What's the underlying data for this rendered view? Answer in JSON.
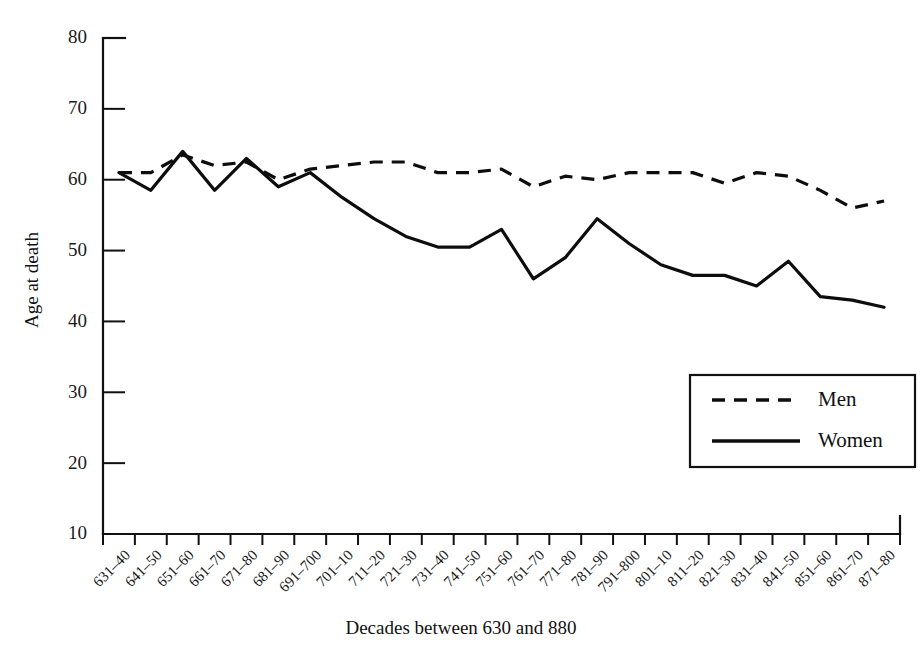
{
  "chart_data": {
    "type": "line",
    "title": "",
    "xlabel": "Decades between 630 and 880",
    "ylabel": "Age at death",
    "ylim": [
      10,
      80
    ],
    "yticks": [
      10,
      20,
      30,
      40,
      50,
      60,
      70,
      80
    ],
    "ytick_labels": [
      "10",
      "20",
      "30",
      "40",
      "50",
      "60",
      "70",
      "80"
    ],
    "grid": false,
    "legend_position": "lower-right",
    "categories": [
      "631–40",
      "641–50",
      "651–60",
      "661–70",
      "671–80",
      "681–90",
      "691–700",
      "701–10",
      "711–20",
      "721–30",
      "731–40",
      "741–50",
      "751–60",
      "761–70",
      "771–80",
      "781–90",
      "791–800",
      "801–10",
      "811–20",
      "821–30",
      "831–40",
      "841–50",
      "851–60",
      "861–70",
      "871–80"
    ],
    "series": [
      {
        "name": "Men",
        "style": "dashed",
        "values": [
          61,
          61,
          63.5,
          62,
          62.5,
          60,
          61.5,
          62,
          62.5,
          62.5,
          61,
          61,
          61.5,
          59,
          60.5,
          60,
          61,
          61,
          61,
          59.5,
          61,
          60.5,
          58.5,
          56,
          57
        ]
      },
      {
        "name": "Women",
        "style": "solid",
        "values": [
          61,
          58.5,
          64,
          58.5,
          63,
          59,
          61,
          57.5,
          54.5,
          52,
          50.5,
          50.5,
          53,
          46,
          49,
          54.5,
          51,
          48,
          46.5,
          46.5,
          45,
          48.5,
          43.5,
          43,
          42
        ]
      }
    ]
  },
  "legend": {
    "entries": [
      {
        "label": "Men",
        "style": "dashed"
      },
      {
        "label": "Women",
        "style": "solid"
      }
    ]
  }
}
